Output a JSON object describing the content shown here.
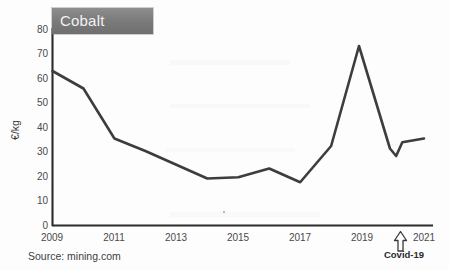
{
  "banner": {
    "title": "Cobalt"
  },
  "axes": {
    "y_label": "€/kg",
    "y_ticks": [
      "0",
      "10",
      "20",
      "30",
      "40",
      "50",
      "60",
      "70",
      "80"
    ],
    "x_ticks": [
      "2009",
      "2011",
      "2013",
      "2015",
      "2017",
      "2019",
      "2021"
    ]
  },
  "annotation": {
    "covid_label": "Covid-19",
    "arrow_icon": "arrow-up-outline-icon"
  },
  "source": {
    "text": "Source: mining.com"
  },
  "colors": {
    "line": "#3d3d3d",
    "axis": "#2b2b2b",
    "banner_bg": "#7c7c7c",
    "banner_text": "#f2f2f2",
    "tick_text": "#4a4a4a",
    "page_bg": "#fdfdfd"
  },
  "chart_data": {
    "type": "line",
    "title": "Cobalt",
    "xlabel": "",
    "ylabel": "€/kg",
    "xlim": [
      2009,
      2021
    ],
    "ylim": [
      0,
      80
    ],
    "grid": false,
    "legend": "none",
    "source": "Source: mining.com",
    "annotations": [
      {
        "text": "Covid-19",
        "x": 2020.0,
        "y": 0,
        "marker": "up-arrow"
      }
    ],
    "series": [
      {
        "name": "Cobalt price",
        "x": [
          2009,
          2010,
          2011,
          2012,
          2013,
          2014,
          2015,
          2016,
          2017,
          2018,
          2018.9,
          2019.9,
          2020.1,
          2020.3,
          2021
        ],
        "values": [
          62,
          55,
          35,
          30,
          24.5,
          19,
          19.5,
          23,
          17.5,
          32,
          72,
          31,
          28,
          33.5,
          35
        ]
      }
    ]
  }
}
